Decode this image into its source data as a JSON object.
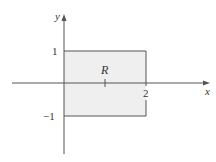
{
  "figure": {
    "type": "region-diagram",
    "region_label": "R",
    "region_fill": "#eeeeee",
    "line_color": "#555555",
    "axes": {
      "x_label": "x",
      "y_label": "y"
    },
    "ticks": {
      "y_top": "1",
      "y_bottom": "−1",
      "x_right": "2"
    },
    "rectangle": {
      "x_min": 0,
      "x_max": 2,
      "y_min": -1,
      "y_max": 1
    }
  }
}
